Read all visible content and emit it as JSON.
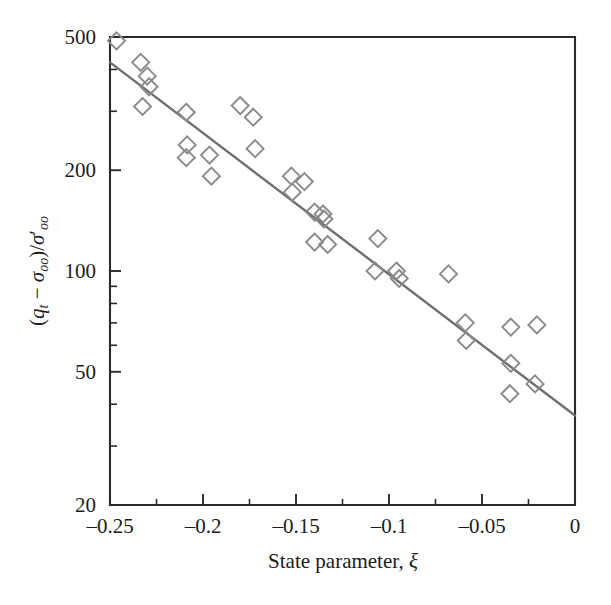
{
  "chart_data": {
    "type": "scatter",
    "title": "",
    "xlabel": "State parameter, ξ",
    "ylabel": "(qₜ − σₒₒ)/σ′ₒₒ",
    "xlabel_parts": {
      "text": "State parameter,",
      "symbol": "ξ"
    },
    "ylabel_parts": {
      "open_paren": "(",
      "q": "q",
      "q_sub": "t",
      "minus": "−",
      "sigma": "σ",
      "sigma_sub": "oo",
      "close_paren": ")",
      "slash": "/",
      "sigma2": "σ",
      "prime": "′",
      "sigma2_sub": "oo"
    },
    "xscale": "linear",
    "yscale": "log",
    "xlim": [
      -0.25,
      0
    ],
    "ylim": [
      20,
      500
    ],
    "grid": false,
    "legend": false,
    "xticks": [
      -0.25,
      -0.2,
      -0.15,
      -0.1,
      -0.05,
      0
    ],
    "xticklabels": [
      "-0.25",
      "-0.2",
      "-0.15",
      "-0.1",
      "-0.05",
      "0"
    ],
    "xminorticks": [
      -0.225,
      -0.175,
      -0.125,
      -0.075,
      -0.025
    ],
    "yticks": [
      500,
      200,
      100,
      50,
      20
    ],
    "yticklabels": [
      "500",
      "200",
      "100",
      "50",
      "20"
    ],
    "yminorticks": [
      400,
      300,
      90,
      80,
      70,
      60,
      40,
      30
    ],
    "marker_style": "open-diamond",
    "marker_color": "#8a8a8a",
    "line_color": "#6f6f6f",
    "axis_color": "#2b2b2b",
    "series": [
      {
        "name": "data",
        "points": [
          [
            -0.2465,
            487
          ],
          [
            -0.2335,
            420
          ],
          [
            -0.2325,
            310
          ],
          [
            -0.23,
            382
          ],
          [
            -0.229,
            355
          ],
          [
            -0.209,
            298
          ],
          [
            -0.2085,
            238
          ],
          [
            -0.209,
            218
          ],
          [
            -0.1965,
            222
          ],
          [
            -0.1955,
            192
          ],
          [
            -0.18,
            312
          ],
          [
            -0.173,
            288
          ],
          [
            -0.172,
            232
          ],
          [
            -0.1525,
            192
          ],
          [
            -0.152,
            172
          ],
          [
            -0.1455,
            185
          ],
          [
            -0.14,
            150
          ],
          [
            -0.1355,
            148
          ],
          [
            -0.135,
            143
          ],
          [
            -0.14,
            122
          ],
          [
            -0.133,
            120
          ],
          [
            -0.106,
            125
          ],
          [
            -0.1075,
            100
          ],
          [
            -0.096,
            100
          ],
          [
            -0.0945,
            95
          ],
          [
            -0.068,
            98
          ],
          [
            -0.059,
            70
          ],
          [
            -0.0585,
            62
          ],
          [
            -0.0345,
            68
          ],
          [
            -0.0345,
            53
          ],
          [
            -0.035,
            43
          ],
          [
            -0.0205,
            69
          ],
          [
            -0.0215,
            46
          ]
        ]
      }
    ],
    "fit_line": {
      "name": "regression-line",
      "x": [
        -0.25,
        0
      ],
      "y": [
        420,
        37
      ]
    }
  }
}
